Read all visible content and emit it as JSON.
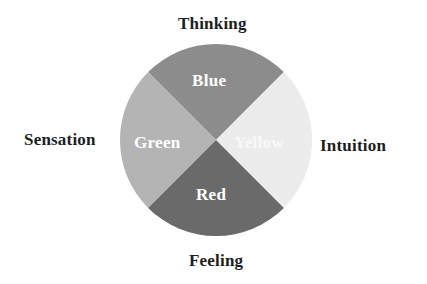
{
  "diagram": {
    "type": "four-quadrant-wheel",
    "center": {
      "x": 216,
      "y": 140
    },
    "radius": 96,
    "functions": {
      "top": "Thinking",
      "left": "Sensation",
      "right": "Intuition",
      "bottom": "Feeling"
    },
    "quadrants": [
      {
        "position": "top",
        "label": "Blue",
        "fill": "#8c8c8c",
        "function": "Thinking"
      },
      {
        "position": "left",
        "label": "Green",
        "fill": "#b4b4b4",
        "function": "Sensation"
      },
      {
        "position": "right",
        "label": "Yellow",
        "fill": "#ececec",
        "function": "Intuition"
      },
      {
        "position": "bottom",
        "label": "Red",
        "fill": "#6a6a6a",
        "function": "Feeling"
      }
    ]
  }
}
